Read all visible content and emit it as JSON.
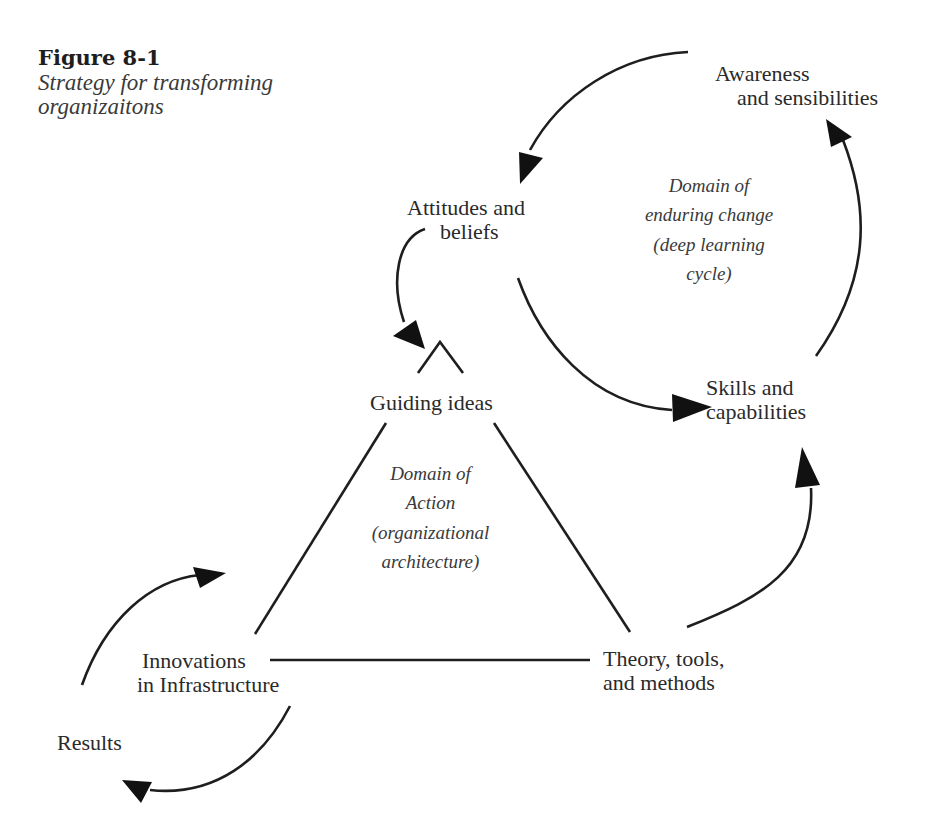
{
  "figure": {
    "number": "Figure 8-1",
    "caption": "Strategy for transforming organizaitons"
  },
  "nodes": {
    "awareness": {
      "line1": "Awareness",
      "line2": "and sensibilities"
    },
    "attitudes": {
      "line1": "Attitudes and",
      "line2": "beliefs"
    },
    "skills": {
      "line1": "Skills and",
      "line2": "capabilities"
    },
    "guiding": {
      "line1": "Guiding ideas"
    },
    "innovations": {
      "line1": "Innovations",
      "line2": "in Infrastructure"
    },
    "theory": {
      "line1": "Theory, tools,",
      "line2": "and methods"
    },
    "results": {
      "line1": "Results"
    }
  },
  "domains": {
    "enduring_change": [
      "Domain of",
      "enduring change",
      "(deep learning",
      "cycle)"
    ],
    "action": [
      "Domain of",
      "Action",
      "(organizational",
      "architecture)"
    ]
  },
  "colors": {
    "ink": "#1e1e1e",
    "text": "#2a2a2a",
    "italic_text": "#3a3a3a",
    "background": "#ffffff"
  }
}
